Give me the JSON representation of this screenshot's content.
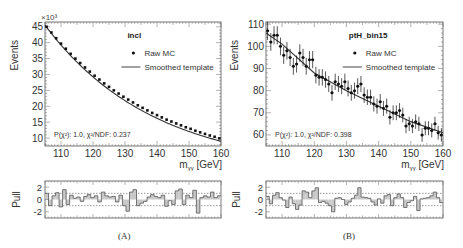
{
  "chart_data": [
    {
      "panel": "A",
      "type": "scatter",
      "caption": "(A)",
      "title": "incl",
      "xlabel": "m_γγ [GeV]",
      "ylabel": "Events",
      "y_multiplier": "×10³",
      "xlim": [
        105,
        160
      ],
      "ylim": [
        7.5,
        46.5
      ],
      "xticks": [
        110,
        120,
        130,
        140,
        150,
        160
      ],
      "yticks": [
        10,
        15,
        20,
        25,
        30,
        35,
        40,
        45
      ],
      "legend": [
        "Raw MC",
        "Smoothed template"
      ],
      "annotation": "P(χ²): 1.0, χ²/NDF: 0.237",
      "series": [
        {
          "name": "Raw MC",
          "x": [
            105.5,
            107,
            108.5,
            110,
            111.5,
            113,
            114.5,
            116,
            117.5,
            119,
            120.5,
            122,
            123.5,
            125,
            126.5,
            128,
            129.5,
            131,
            132.5,
            134,
            135.5,
            137,
            138.5,
            140,
            141.5,
            143,
            144.5,
            146,
            147.5,
            149,
            150.5,
            152,
            153.5,
            155,
            156.5,
            158,
            159.5
          ],
          "values": [
            45.0,
            43.2,
            41.4,
            39.7,
            38.1,
            36.5,
            35.0,
            33.6,
            32.2,
            30.9,
            29.6,
            28.4,
            27.2,
            26.1,
            25.0,
            24.0,
            23.0,
            22.1,
            21.2,
            20.3,
            19.5,
            18.7,
            17.9,
            17.2,
            16.5,
            15.8,
            15.2,
            14.6,
            14.0,
            13.4,
            12.9,
            12.3,
            11.8,
            11.3,
            10.8,
            10.4,
            9.9
          ]
        },
        {
          "name": "Smoothed template",
          "x": [
            105,
            160
          ],
          "values": [
            45.5,
            9.0
          ]
        }
      ],
      "pull": {
        "ylabel": "Pull",
        "ylim": [
          -3,
          3
        ],
        "yticks": [
          -2,
          0,
          2
        ],
        "values": [
          1.0,
          -1.0,
          0.6,
          1.1,
          -1.2,
          1.6,
          -0.8,
          0.7,
          0.2,
          0.4,
          -0.3,
          0.5,
          0.8,
          0.3,
          0.6,
          -0.4,
          1.2,
          0.6,
          0.4,
          0.5,
          -0.4,
          0.7,
          -1.0,
          -1.9,
          1.2,
          1.6,
          -1.0,
          -0.6,
          -0.3,
          0.4,
          0.8,
          0.5,
          0.3,
          0.7,
          -1.1,
          -0.2,
          -0.8,
          1.4,
          1.7,
          -0.8,
          0.7,
          0.3,
          1.5,
          -2.2,
          0.3,
          0.6,
          0.4,
          1.2,
          0.3,
          0.6
        ]
      }
    },
    {
      "panel": "B",
      "type": "scatter",
      "caption": "(B)",
      "title": "ptH_bin15",
      "xlabel": "m_γγ [GeV]",
      "ylabel": "Events",
      "xlim": [
        105,
        160
      ],
      "ylim": [
        55,
        111
      ],
      "xticks": [
        110,
        120,
        130,
        140,
        150,
        160
      ],
      "yticks": [
        60,
        70,
        80,
        90,
        100,
        110
      ],
      "legend": [
        "Raw MC",
        "Smoothed template"
      ],
      "annotation": "P(χ²): 1.0, χ²/NDF: 0.398",
      "series": [
        {
          "name": "Raw MC",
          "x": [
            105.5,
            106.5,
            107.5,
            108.5,
            109.5,
            110.5,
            111.5,
            112.5,
            113.5,
            114.5,
            115.5,
            116.5,
            117.5,
            118.5,
            119.5,
            120.5,
            121.5,
            122.5,
            123.5,
            124.5,
            125.5,
            126.5,
            127.5,
            128.5,
            129.5,
            130.5,
            131.5,
            132.5,
            133.5,
            134.5,
            135.5,
            136.5,
            137.5,
            138.5,
            139.5,
            140.5,
            141.5,
            142.5,
            143.5,
            144.5,
            145.5,
            146.5,
            147.5,
            148.5,
            149.5,
            150.5,
            151.5,
            152.5,
            153.5,
            154.5,
            155.5,
            156.5,
            157.5,
            158.5,
            159.5
          ],
          "values": [
            107,
            102,
            105,
            105,
            100,
            96,
            98,
            95,
            91,
            92,
            97,
            95,
            91,
            94,
            94,
            87,
            86,
            86,
            85,
            83,
            79,
            84,
            83,
            82,
            84,
            81,
            79,
            80,
            82,
            83,
            78,
            77,
            77,
            74,
            73,
            75,
            72,
            73,
            68,
            70,
            70,
            71,
            69,
            64,
            65,
            64,
            66,
            65,
            60,
            63,
            63,
            62,
            65,
            61,
            60
          ]
        },
        {
          "name": "Smoothed template",
          "x": [
            105,
            110,
            120,
            130,
            140,
            150,
            160
          ],
          "values": [
            106,
            101,
            88,
            80,
            73,
            66,
            61
          ]
        }
      ],
      "pull": {
        "ylabel": "Pull",
        "ylim": [
          -3,
          3
        ],
        "yticks": [
          -2,
          0,
          2
        ],
        "values": [
          0.5,
          -0.7,
          0.7,
          1.1,
          0.3,
          -0.1,
          -1.3,
          0.4,
          -0.7,
          -1.6,
          -0.9,
          1.4,
          1.2,
          0.3,
          1.4,
          1.9,
          -0.5,
          -0.3,
          -0.6,
          -1.0,
          -2.0,
          0.2,
          0.3,
          0.0,
          -0.8,
          -0.4,
          0.2,
          0.7,
          1.9,
          0.4,
          0.3,
          0.2,
          -0.4,
          -0.9,
          0.1,
          -0.6,
          0.6,
          0.8,
          -1.0,
          0.3,
          0.9,
          0.3,
          -1.3,
          -0.5,
          -0.2,
          0.5,
          -1.8,
          0.1,
          0.2,
          0.3,
          0.6,
          1.2,
          0.3,
          -0.5
        ]
      }
    }
  ],
  "captions": {
    "a": "(A)",
    "b": "(B)"
  }
}
